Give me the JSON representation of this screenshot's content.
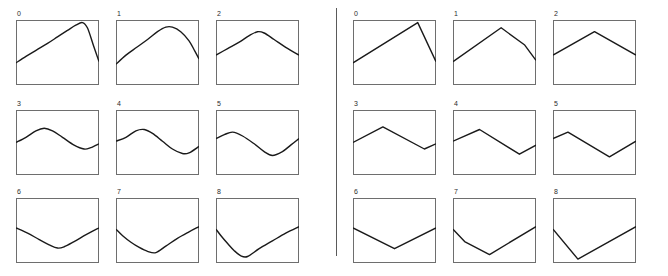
{
  "figure": {
    "title": "",
    "panel_width": 83,
    "panel_height": 65,
    "divider": "vertical-rule",
    "stroke_color": "#1a1a1a",
    "frame_color": "#6e6e6e",
    "background_color": "#ffffff"
  },
  "groups": [
    {
      "id": "smooth",
      "name": "smooth-curves",
      "panel_count": 9
    },
    {
      "id": "linear",
      "name": "piecewise-linear-curves",
      "panel_count": 9
    }
  ],
  "chart_data": [
    {
      "type": "line",
      "title": "0",
      "group": "smooth",
      "xlabel": "",
      "ylabel": "",
      "xlim": [
        0,
        1
      ],
      "ylim": [
        0,
        1
      ],
      "grid": false,
      "legend": "none",
      "smoothing": "spline",
      "x": [
        0.0,
        0.12,
        0.25,
        0.38,
        0.5,
        0.62,
        0.72,
        0.8,
        0.86,
        0.93,
        1.0
      ],
      "y": [
        0.34,
        0.44,
        0.54,
        0.64,
        0.74,
        0.84,
        0.92,
        0.96,
        0.88,
        0.62,
        0.36
      ]
    },
    {
      "type": "line",
      "title": "1",
      "group": "smooth",
      "xlabel": "",
      "ylabel": "",
      "xlim": [
        0,
        1
      ],
      "ylim": [
        0,
        1
      ],
      "grid": false,
      "legend": "none",
      "smoothing": "spline",
      "x": [
        0.0,
        0.12,
        0.25,
        0.38,
        0.5,
        0.6,
        0.68,
        0.78,
        0.88,
        0.95,
        1.0
      ],
      "y": [
        0.32,
        0.46,
        0.58,
        0.7,
        0.82,
        0.89,
        0.89,
        0.82,
        0.68,
        0.52,
        0.4
      ]
    },
    {
      "type": "line",
      "title": "2",
      "group": "smooth",
      "xlabel": "",
      "ylabel": "",
      "xlim": [
        0,
        1
      ],
      "ylim": [
        0,
        1
      ],
      "grid": false,
      "legend": "none",
      "smoothing": "spline",
      "x": [
        0.0,
        0.14,
        0.28,
        0.4,
        0.5,
        0.58,
        0.7,
        0.84,
        1.0
      ],
      "y": [
        0.46,
        0.56,
        0.66,
        0.76,
        0.82,
        0.8,
        0.7,
        0.58,
        0.46
      ]
    },
    {
      "type": "line",
      "title": "3",
      "group": "smooth",
      "xlabel": "",
      "ylabel": "",
      "xlim": [
        0,
        1
      ],
      "ylim": [
        0,
        1
      ],
      "grid": false,
      "legend": "none",
      "smoothing": "spline",
      "x": [
        0.0,
        0.12,
        0.24,
        0.34,
        0.44,
        0.56,
        0.7,
        0.82,
        0.9,
        1.0
      ],
      "y": [
        0.5,
        0.58,
        0.68,
        0.72,
        0.68,
        0.58,
        0.46,
        0.4,
        0.42,
        0.48
      ]
    },
    {
      "type": "line",
      "title": "4",
      "group": "smooth",
      "xlabel": "",
      "ylabel": "",
      "xlim": [
        0,
        1
      ],
      "ylim": [
        0,
        1
      ],
      "grid": false,
      "legend": "none",
      "smoothing": "spline",
      "x": [
        0.0,
        0.12,
        0.24,
        0.34,
        0.44,
        0.56,
        0.68,
        0.8,
        0.88,
        1.0
      ],
      "y": [
        0.52,
        0.58,
        0.68,
        0.7,
        0.64,
        0.52,
        0.4,
        0.33,
        0.34,
        0.44
      ]
    },
    {
      "type": "line",
      "title": "5",
      "group": "smooth",
      "xlabel": "",
      "ylabel": "",
      "xlim": [
        0,
        1
      ],
      "ylim": [
        0,
        1
      ],
      "grid": false,
      "legend": "none",
      "smoothing": "spline",
      "x": [
        0.0,
        0.1,
        0.2,
        0.32,
        0.46,
        0.58,
        0.68,
        0.8,
        0.9,
        1.0
      ],
      "y": [
        0.56,
        0.62,
        0.66,
        0.6,
        0.48,
        0.36,
        0.3,
        0.36,
        0.46,
        0.56
      ]
    },
    {
      "type": "line",
      "title": "6",
      "group": "smooth",
      "xlabel": "",
      "ylabel": "",
      "xlim": [
        0,
        1
      ],
      "ylim": [
        0,
        1
      ],
      "grid": false,
      "legend": "none",
      "smoothing": "spline",
      "x": [
        0.0,
        0.14,
        0.28,
        0.4,
        0.5,
        0.58,
        0.7,
        0.85,
        1.0
      ],
      "y": [
        0.54,
        0.46,
        0.36,
        0.28,
        0.23,
        0.25,
        0.33,
        0.44,
        0.54
      ]
    },
    {
      "type": "line",
      "title": "7",
      "group": "smooth",
      "xlabel": "",
      "ylabel": "",
      "xlim": [
        0,
        1
      ],
      "ylim": [
        0,
        1
      ],
      "grid": false,
      "legend": "none",
      "smoothing": "spline",
      "x": [
        0.0,
        0.08,
        0.18,
        0.28,
        0.38,
        0.48,
        0.6,
        0.74,
        0.88,
        1.0
      ],
      "y": [
        0.52,
        0.42,
        0.32,
        0.24,
        0.18,
        0.16,
        0.26,
        0.38,
        0.48,
        0.56
      ]
    },
    {
      "type": "line",
      "title": "8",
      "group": "smooth",
      "xlabel": "",
      "ylabel": "",
      "xlim": [
        0,
        1
      ],
      "ylim": [
        0,
        1
      ],
      "grid": false,
      "legend": "none",
      "smoothing": "spline",
      "x": [
        0.0,
        0.06,
        0.14,
        0.22,
        0.3,
        0.38,
        0.52,
        0.68,
        0.84,
        1.0
      ],
      "y": [
        0.52,
        0.42,
        0.3,
        0.19,
        0.11,
        0.1,
        0.22,
        0.34,
        0.46,
        0.56
      ]
    },
    {
      "type": "line",
      "title": "0",
      "group": "linear",
      "xlabel": "",
      "ylabel": "",
      "xlim": [
        0,
        1
      ],
      "ylim": [
        0,
        1
      ],
      "grid": false,
      "legend": "none",
      "smoothing": "linear",
      "x": [
        0.0,
        0.78,
        1.0
      ],
      "y": [
        0.34,
        0.96,
        0.36
      ]
    },
    {
      "type": "line",
      "title": "1",
      "group": "linear",
      "xlabel": "",
      "ylabel": "",
      "xlim": [
        0,
        1
      ],
      "ylim": [
        0,
        1
      ],
      "grid": false,
      "legend": "none",
      "smoothing": "linear",
      "x": [
        0.0,
        0.58,
        0.86,
        1.0
      ],
      "y": [
        0.36,
        0.88,
        0.62,
        0.38
      ]
    },
    {
      "type": "line",
      "title": "2",
      "group": "linear",
      "xlabel": "",
      "ylabel": "",
      "xlim": [
        0,
        1
      ],
      "ylim": [
        0,
        1
      ],
      "grid": false,
      "legend": "none",
      "smoothing": "linear",
      "x": [
        0.0,
        0.5,
        1.0
      ],
      "y": [
        0.46,
        0.82,
        0.46
      ]
    },
    {
      "type": "line",
      "title": "3",
      "group": "linear",
      "xlabel": "",
      "ylabel": "",
      "xlim": [
        0,
        1
      ],
      "ylim": [
        0,
        1
      ],
      "grid": false,
      "legend": "none",
      "smoothing": "linear",
      "x": [
        0.0,
        0.36,
        0.86,
        1.0
      ],
      "y": [
        0.5,
        0.74,
        0.4,
        0.48
      ]
    },
    {
      "type": "line",
      "title": "4",
      "group": "linear",
      "xlabel": "",
      "ylabel": "",
      "xlim": [
        0,
        1
      ],
      "ylim": [
        0,
        1
      ],
      "grid": false,
      "legend": "none",
      "smoothing": "linear",
      "x": [
        0.0,
        0.32,
        0.8,
        1.0
      ],
      "y": [
        0.52,
        0.7,
        0.32,
        0.46
      ]
    },
    {
      "type": "line",
      "title": "5",
      "group": "linear",
      "xlabel": "",
      "ylabel": "",
      "xlim": [
        0,
        1
      ],
      "ylim": [
        0,
        1
      ],
      "grid": false,
      "legend": "none",
      "smoothing": "linear",
      "x": [
        0.0,
        0.18,
        0.68,
        1.0
      ],
      "y": [
        0.56,
        0.66,
        0.28,
        0.52
      ]
    },
    {
      "type": "line",
      "title": "6",
      "group": "linear",
      "xlabel": "",
      "ylabel": "",
      "xlim": [
        0,
        1
      ],
      "ylim": [
        0,
        1
      ],
      "grid": false,
      "legend": "none",
      "smoothing": "linear",
      "x": [
        0.0,
        0.5,
        1.0
      ],
      "y": [
        0.54,
        0.22,
        0.54
      ]
    },
    {
      "type": "line",
      "title": "7",
      "group": "linear",
      "xlabel": "",
      "ylabel": "",
      "xlim": [
        0,
        1
      ],
      "ylim": [
        0,
        1
      ],
      "grid": false,
      "legend": "none",
      "smoothing": "linear",
      "x": [
        0.0,
        0.14,
        0.44,
        1.0
      ],
      "y": [
        0.52,
        0.33,
        0.13,
        0.56
      ]
    },
    {
      "type": "line",
      "title": "8",
      "group": "linear",
      "xlabel": "",
      "ylabel": "",
      "xlim": [
        0,
        1
      ],
      "ylim": [
        0,
        1
      ],
      "grid": false,
      "legend": "none",
      "smoothing": "linear",
      "x": [
        0.0,
        0.3,
        1.0
      ],
      "y": [
        0.52,
        0.06,
        0.56
      ]
    }
  ]
}
